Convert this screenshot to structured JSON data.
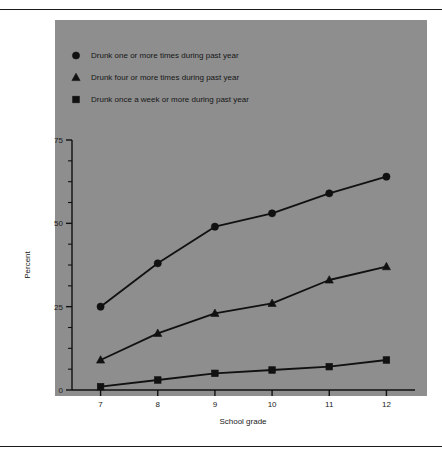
{
  "chart_data": {
    "type": "line",
    "title": "",
    "xlabel": "School grade",
    "ylabel": "Percent",
    "categories": [
      "7",
      "8",
      "9",
      "10",
      "11",
      "12"
    ],
    "x": [
      7,
      8,
      9,
      10,
      11,
      12
    ],
    "xlim": [
      6.5,
      12.5
    ],
    "ylim": [
      0,
      80
    ],
    "yticks": [
      0,
      25,
      50,
      75
    ],
    "yticklabels": [
      "0",
      "25",
      "50",
      "75"
    ],
    "yminor_step": 6.25,
    "grid": false,
    "legend_position": "upper-left-inside",
    "background": "#8e8e8e",
    "ink": "#111111",
    "series": [
      {
        "name": "Drunk one or more times during past year",
        "marker": "circle",
        "values": [
          25,
          38,
          49,
          53,
          59,
          64
        ]
      },
      {
        "name": "Drunk four or more times during past year",
        "marker": "triangle",
        "values": [
          9,
          17,
          23,
          26,
          33,
          37
        ]
      },
      {
        "name": "Drunk once a week or more during past year",
        "marker": "square",
        "values": [
          1,
          3,
          5,
          6,
          7,
          9
        ]
      }
    ]
  },
  "legend": {
    "items": [
      {
        "marker": "circle-marker-icon",
        "label": "Drunk one or more times during past year"
      },
      {
        "marker": "triangle-marker-icon",
        "label": "Drunk four or more times during past year"
      },
      {
        "marker": "square-marker-icon",
        "label": "Drunk once a week or more during past year"
      }
    ]
  },
  "axes": {
    "y_title": "Percent",
    "x_title": "School grade",
    "y_labels": [
      "75",
      "50",
      "25",
      "0"
    ],
    "x_labels": [
      "7",
      "8",
      "9",
      "10",
      "11",
      "12"
    ]
  }
}
